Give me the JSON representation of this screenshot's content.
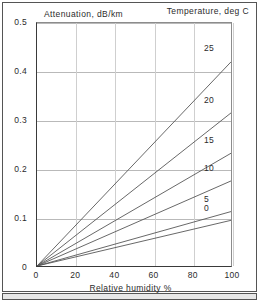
{
  "chart_data": {
    "type": "line",
    "title": "",
    "xlabel": "Relative humidity %",
    "ylabel": "Attenuation, dB/km",
    "legend_title": "Temperature, deg C",
    "legend_position": "right-inline",
    "grid": true,
    "xlim": [
      0,
      100
    ],
    "ylim": [
      0,
      0.5
    ],
    "xticks": [
      0,
      20,
      40,
      60,
      80,
      100
    ],
    "xtick_labels": [
      "0",
      "20",
      "40",
      "60",
      "80",
      "100"
    ],
    "yticks": [
      0,
      0.1,
      0.2,
      0.3,
      0.4,
      0.5
    ],
    "ytick_labels": [
      "0",
      "0.1",
      "0.2",
      "0.3",
      "0.4",
      "0.5"
    ],
    "x": [
      0,
      100
    ],
    "series": [
      {
        "name": "25",
        "label": "25",
        "values": [
          0,
          0.42
        ],
        "color": "#555555"
      },
      {
        "name": "20",
        "label": "20",
        "values": [
          0,
          0.315
        ],
        "color": "#555555"
      },
      {
        "name": "15",
        "label": "15",
        "values": [
          0,
          0.232
        ],
        "color": "#555555"
      },
      {
        "name": "10",
        "label": "10",
        "values": [
          0,
          0.175
        ],
        "color": "#555555"
      },
      {
        "name": "5",
        "label": "5",
        "values": [
          0,
          0.112
        ],
        "color": "#555555"
      },
      {
        "name": "0",
        "label": "0",
        "values": [
          0,
          0.094
        ],
        "color": "#555555"
      }
    ]
  },
  "axes": {
    "ylabel": "Attenuation, dB/km",
    "xlabel": "Relative humidity %",
    "legend_title": "Temperature, deg C"
  },
  "colors": {
    "line": "#555555",
    "grid": "#b9b9b9",
    "axis": "#3a3a3a",
    "text": "#2b2b2b",
    "frame": "#555555",
    "background": "#ffffff"
  }
}
